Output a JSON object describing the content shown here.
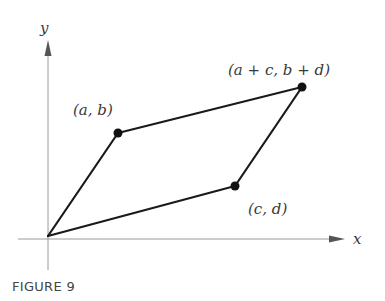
{
  "figure": {
    "caption": "FIGURE 9",
    "axes": {
      "x_label": "x",
      "y_label": "y"
    },
    "points": [
      {
        "id": "origin",
        "label": "",
        "x": 48,
        "y": 236
      },
      {
        "id": "a_b",
        "label": "(a, b)",
        "x": 118,
        "y": 133
      },
      {
        "id": "a_plus_c_b_plus_d",
        "label": "(a + c, b + d)",
        "x": 302,
        "y": 87
      },
      {
        "id": "c_d",
        "label": "(c, d)",
        "x": 235,
        "y": 186
      }
    ],
    "shape": "parallelogram",
    "colors": {
      "axis": "#9a9a9a",
      "edge": "#1a1a1a",
      "label": "#3a3a3a"
    }
  }
}
